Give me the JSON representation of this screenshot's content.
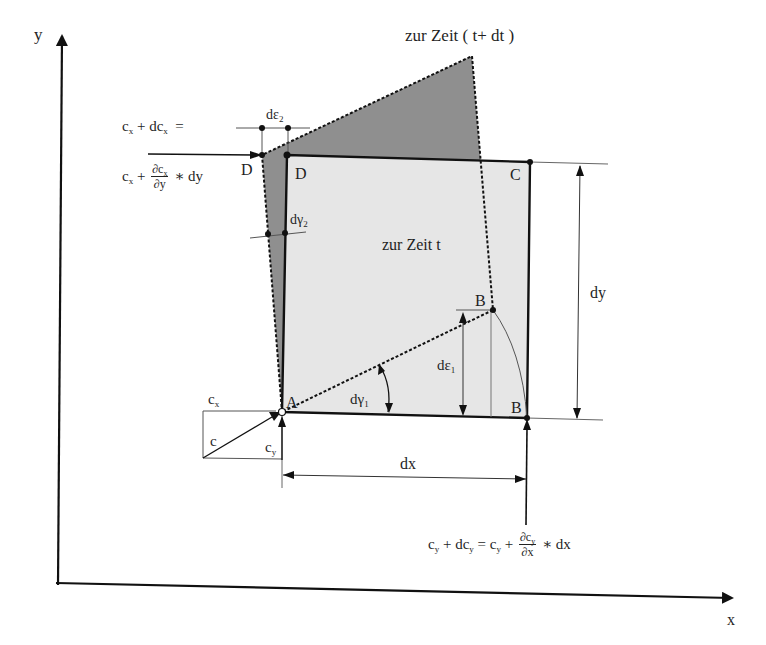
{
  "axes": {
    "x_label": "x",
    "y_label": "y"
  },
  "labels": {
    "time_t_plus_dt": "zur Zeit ( t+ dt )",
    "time_t": "zur Zeit  t",
    "point_A": "A",
    "point_B": "B",
    "point_B_prime": "B",
    "point_C": "C",
    "point_D": "D",
    "point_D_prime": "D",
    "d_eps_1": "dε",
    "d_eps_1_sub": "1",
    "d_eps_2": "dε",
    "d_eps_2_sub": "2",
    "d_gamma_1": "dγ",
    "d_gamma_1_sub": "1",
    "d_gamma_2": "dγ",
    "d_gamma_2_sub": "2",
    "dx": "dx",
    "dy": "dy",
    "c": "c",
    "c_x": "c",
    "c_x_sub": "x",
    "c_y": "c",
    "c_y_sub": "y"
  },
  "equations": {
    "cx_top": {
      "lhs_c": "c",
      "lhs_c_sub": "x",
      "plus": "+ dc",
      "plus_sub": "x",
      "equals": "="
    },
    "cx_bottom": {
      "c": "c",
      "c_sub": "x",
      "plus": "+",
      "num": "∂c",
      "num_sub": "x",
      "den": "∂y",
      "tail": "∗ dy"
    },
    "cy": {
      "c": "c",
      "c_sub": "y",
      "plus_dc": "+ dc",
      "plus_dc_sub": "y",
      "equals": "= c",
      "equals_sub": "y",
      "plus": "+",
      "num": "∂c",
      "num_sub": "y",
      "den": "∂x",
      "tail": "∗ dx"
    }
  },
  "colors": {
    "deformed_fill": "#8f8f8f",
    "original_fill": "#e6e6e6",
    "line": "#1a1a1a",
    "thin_line": "#555555"
  }
}
